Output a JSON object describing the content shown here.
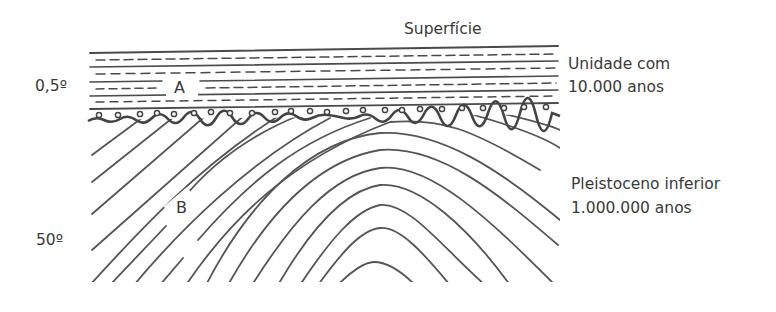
{
  "diagram": {
    "type": "geological cross-section",
    "labels": {
      "surface": "Superfície",
      "unit_a_line1": "Unidade com",
      "unit_a_line2": "10.000 anos",
      "unit_b_line1": "Pleistoceno inferior",
      "unit_b_line2": "1.000.000 anos",
      "layer_a": "A",
      "layer_b": "B",
      "dip_a": "0,5º",
      "dip_b": "50º"
    },
    "colors": {
      "line": "#4a4a4a",
      "text": "#3a3a3a",
      "background": "#ffffff"
    }
  }
}
